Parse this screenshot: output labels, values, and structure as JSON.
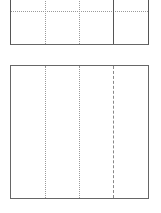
{
  "diagram": {
    "panels": [
      {
        "id": "top",
        "vertical_lines": [
          {
            "x": 35,
            "style": "dotted"
          },
          {
            "x": 69,
            "style": "dotted"
          },
          {
            "x": 103,
            "style": "solid"
          }
        ],
        "horizontal_lines": [
          {
            "y": 13,
            "style": "dotted"
          }
        ]
      },
      {
        "id": "bottom",
        "vertical_lines": [
          {
            "x": 35,
            "style": "dotted"
          },
          {
            "x": 69,
            "style": "dotted"
          },
          {
            "x": 103,
            "style": "dashed"
          }
        ],
        "horizontal_lines": []
      }
    ],
    "colors": {
      "border": "#555555",
      "dotted": "#9a9a9a",
      "dashed": "#888888",
      "background": "#ffffff"
    }
  }
}
